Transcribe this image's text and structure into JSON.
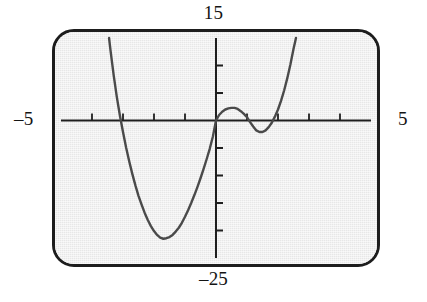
{
  "device": {
    "name": "graphing-calculator-screen",
    "screen_bg": "#e7e7e7",
    "bezel_color": "#1d1d1d"
  },
  "labels": {
    "top": "15",
    "bottom": "–25",
    "left": "–5",
    "right": "5"
  },
  "chart_data": {
    "type": "line",
    "title": "",
    "subtitle": "",
    "xlabel": "",
    "ylabel": "",
    "xlim": [
      -5,
      5
    ],
    "ylim": [
      -25,
      15
    ],
    "xticks": [
      -4,
      -3,
      -2,
      -1,
      1,
      2,
      3,
      4
    ],
    "yticks": [
      -20,
      -15,
      -10,
      -5,
      5,
      10
    ],
    "grid": false,
    "legend": false,
    "axis_line_color": "#1f1f1f",
    "curve_color": "#4a4a4a",
    "curve_width": 2.4,
    "tick_length_px": 7,
    "annotations": [
      {
        "name": "global-minimum",
        "x": -1.95,
        "y": -21.5
      },
      {
        "name": "local-maximum",
        "x": 0.6,
        "y": 2.0
      },
      {
        "name": "local-minimum",
        "x": 1.45,
        "y": -2.1
      },
      {
        "name": "x-intercept-left",
        "x": -3.1,
        "y": 0
      },
      {
        "name": "x-intercept-origin",
        "x": 0.0,
        "y": 0
      },
      {
        "name": "x-intercept-right",
        "x": 2.0,
        "y": 0
      }
    ],
    "series": [
      {
        "name": "quartic",
        "points": [
          [
            -3.45,
            15.0
          ],
          [
            -3.4,
            12.6
          ],
          [
            -3.3,
            8.2
          ],
          [
            -3.2,
            4.3
          ],
          [
            -3.1,
            0.9
          ],
          [
            -3.0,
            -2.1
          ],
          [
            -2.9,
            -4.9
          ],
          [
            -2.8,
            -7.4
          ],
          [
            -2.7,
            -9.7
          ],
          [
            -2.6,
            -11.8
          ],
          [
            -2.5,
            -13.7
          ],
          [
            -2.4,
            -15.3
          ],
          [
            -2.3,
            -16.8
          ],
          [
            -2.2,
            -18.1
          ],
          [
            -2.1,
            -19.2
          ],
          [
            -2.0,
            -20.1
          ],
          [
            -1.9,
            -20.8
          ],
          [
            -1.8,
            -21.3
          ],
          [
            -1.7,
            -21.5
          ],
          [
            -1.6,
            -21.4
          ],
          [
            -1.5,
            -21.2
          ],
          [
            -1.4,
            -20.8
          ],
          [
            -1.3,
            -20.2
          ],
          [
            -1.2,
            -19.5
          ],
          [
            -1.1,
            -18.6
          ],
          [
            -1.0,
            -17.5
          ],
          [
            -0.9,
            -16.3
          ],
          [
            -0.8,
            -15.0
          ],
          [
            -0.7,
            -13.6
          ],
          [
            -0.6,
            -12.1
          ],
          [
            -0.5,
            -10.5
          ],
          [
            -0.4,
            -8.8
          ],
          [
            -0.3,
            -7.0
          ],
          [
            -0.2,
            -5.1
          ],
          [
            -0.1,
            -2.9
          ],
          [
            0.0,
            0.0
          ],
          [
            0.1,
            1.0
          ],
          [
            0.2,
            1.6
          ],
          [
            0.3,
            2.0
          ],
          [
            0.4,
            2.2
          ],
          [
            0.5,
            2.3
          ],
          [
            0.6,
            2.3
          ],
          [
            0.7,
            2.1
          ],
          [
            0.8,
            1.7
          ],
          [
            0.9,
            1.2
          ],
          [
            1.0,
            0.6
          ],
          [
            1.1,
            -0.3
          ],
          [
            1.2,
            -1.1
          ],
          [
            1.3,
            -1.8
          ],
          [
            1.4,
            -2.1
          ],
          [
            1.5,
            -2.1
          ],
          [
            1.6,
            -1.8
          ],
          [
            1.7,
            -1.2
          ],
          [
            1.8,
            -0.4
          ],
          [
            1.9,
            0.7
          ],
          [
            2.0,
            2.0
          ],
          [
            2.1,
            3.6
          ],
          [
            2.2,
            5.5
          ],
          [
            2.3,
            7.7
          ],
          [
            2.4,
            10.2
          ],
          [
            2.5,
            13.0
          ],
          [
            2.58,
            15.0
          ]
        ]
      }
    ]
  }
}
